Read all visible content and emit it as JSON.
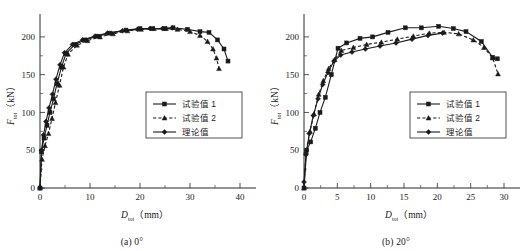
{
  "figure": {
    "name": "two-panel-load-displacement-figure"
  },
  "chart_data": [
    {
      "type": "line",
      "panel_id": "a",
      "caption": "(a) 0°",
      "title": "",
      "xlabel_main": "D",
      "xlabel_sub": "tot",
      "xlabel_unit": "（mm）",
      "ylabel_main": "F",
      "ylabel_sub": "tot",
      "ylabel_unit": "（kN）",
      "xlim": [
        0,
        42
      ],
      "ylim": [
        0,
        225
      ],
      "xticks": [
        0,
        10,
        20,
        30,
        40
      ],
      "yticks": [
        0,
        50,
        100,
        150,
        200
      ],
      "xminorticks": [
        5,
        15,
        25,
        35
      ],
      "yminorticks": [
        25,
        75,
        125,
        175
      ],
      "grid": false,
      "legend_position": "center-right",
      "series": [
        {
          "name": "试验值 1",
          "style": "solid",
          "marker": "square",
          "x": [
            0,
            0.3,
            0.8,
            1.4,
            2.0,
            2.7,
            3.4,
            4.3,
            5.2,
            7.0,
            9.0,
            11.5,
            14.0,
            17.2,
            20.0,
            22.5,
            25.0,
            26.6,
            29.5,
            32.0,
            33.8,
            35.5,
            36.8,
            37.6
          ],
          "y": [
            0,
            48,
            66,
            83,
            100,
            118,
            138,
            160,
            178,
            190,
            196,
            201,
            205,
            209,
            211,
            211,
            211,
            212,
            210,
            207,
            206,
            196,
            184,
            168
          ]
        },
        {
          "name": "试验值 2",
          "style": "dashed",
          "marker": "triangle",
          "x": [
            0,
            0.4,
            1.0,
            1.7,
            2.4,
            3.1,
            3.9,
            4.7,
            5.6,
            7.4,
            9.5,
            12.0,
            14.6,
            17.5,
            20.2,
            22.8,
            25.2,
            27.5,
            30.0,
            32.0,
            33.5,
            34.6,
            35.3,
            35.8
          ],
          "y": [
            0,
            38,
            56,
            72,
            92,
            113,
            136,
            160,
            177,
            189,
            195,
            200,
            204,
            208,
            210,
            211,
            211,
            210,
            207,
            202,
            194,
            184,
            172,
            158
          ]
        },
        {
          "name": "理论值",
          "style": "solid",
          "marker": "diamond",
          "x": [
            0,
            0.3,
            0.7,
            1.2,
            1.8,
            2.5,
            3.2,
            4.0,
            4.9,
            6.5,
            8.5,
            11.0,
            13.5,
            16.5,
            19.5,
            22.0,
            24.5,
            26.5
          ],
          "y": [
            0,
            50,
            70,
            88,
            106,
            124,
            144,
            163,
            179,
            190,
            196,
            201,
            205,
            208,
            210,
            211,
            211,
            212
          ]
        }
      ]
    },
    {
      "type": "line",
      "panel_id": "b",
      "caption": "(b) 20°",
      "title": "",
      "xlabel_main": "D",
      "xlabel_sub": "tot",
      "xlabel_unit": "（mm）",
      "ylabel_main": "F",
      "ylabel_sub": "tot",
      "ylabel_unit": "（kN）",
      "xlim": [
        0,
        31.5
      ],
      "ylim": [
        0,
        225
      ],
      "xticks": [
        0,
        5,
        10,
        15,
        20,
        25,
        30
      ],
      "yticks": [
        0,
        50,
        100,
        150,
        200
      ],
      "xminorticks": [
        2.5,
        7.5,
        12.5,
        17.5,
        22.5,
        27.5
      ],
      "yminorticks": [
        25,
        75,
        125,
        175
      ],
      "grid": false,
      "legend_position": "center-right",
      "series": [
        {
          "name": "试验值 1",
          "style": "solid",
          "marker": "square",
          "x": [
            0,
            0.4,
            1.0,
            1.7,
            2.4,
            3.2,
            4.1,
            5.1,
            6.4,
            8.4,
            10.3,
            12.6,
            15.2,
            17.6,
            20.2,
            22.4,
            24.3,
            26.6,
            28.3,
            29.0
          ],
          "y": [
            0,
            50,
            61,
            79,
            100,
            120,
            150,
            185,
            192,
            198,
            200,
            206,
            212,
            212,
            214,
            211,
            207,
            194,
            173,
            171
          ]
        },
        {
          "name": "试验值 2",
          "style": "dashed",
          "marker": "triangle",
          "x": [
            0,
            0.3,
            0.9,
            1.5,
            2.2,
            2.9,
            3.7,
            4.6,
            5.6,
            7.4,
            9.4,
            11.6,
            14.0,
            16.4,
            18.8,
            21.0,
            23.2,
            25.4,
            27.0,
            28.3,
            29.1
          ],
          "y": [
            0,
            48,
            75,
            98,
            124,
            142,
            158,
            170,
            182,
            186,
            190,
            193,
            197,
            201,
            205,
            206,
            204,
            196,
            186,
            172,
            151
          ]
        },
        {
          "name": "理论值",
          "style": "solid",
          "marker": "diamond",
          "x": [
            0,
            0.3,
            0.8,
            1.4,
            2.1,
            2.8,
            3.6,
            4.5,
            5.5,
            7.2,
            9.2,
            11.4,
            13.8,
            16.2,
            18.6,
            20.8
          ],
          "y": [
            8,
            44,
            72,
            96,
            118,
            137,
            153,
            168,
            176,
            180,
            184,
            188,
            192,
            197,
            202,
            205
          ]
        }
      ]
    }
  ]
}
